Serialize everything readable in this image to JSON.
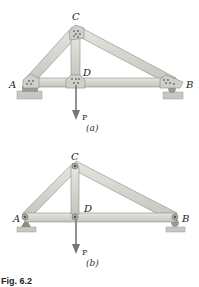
{
  "figure": {
    "caption": "Fig. 6.2",
    "colors": {
      "member_fill": "#d6d6d0",
      "member_stroke": "#8c8c86",
      "plate_fill": "#cfcfc8",
      "support_fill": "#b8b8b2",
      "arrow": "#777777"
    },
    "panels": [
      {
        "id": "a",
        "label": "(a)",
        "type": "gusset-plate truss",
        "joints": {
          "A": "A",
          "B": "B",
          "C": "C",
          "D": "D"
        },
        "load": "P",
        "supports": {
          "A": "fixed block",
          "B": "roller"
        }
      },
      {
        "id": "b",
        "label": "(b)",
        "type": "pin-jointed truss",
        "joints": {
          "A": "A",
          "B": "B",
          "C": "C",
          "D": "D"
        },
        "load": "P",
        "supports": {
          "A": "pin",
          "B": "roller"
        }
      }
    ]
  }
}
